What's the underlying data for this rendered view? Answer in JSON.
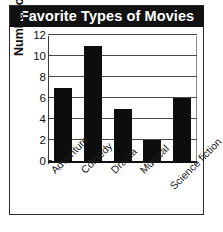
{
  "chart_data": {
    "type": "bar",
    "title": "Favorite Types of Movies",
    "xlabel": "",
    "ylabel": "Number of students",
    "categories": [
      "Adventure",
      "Comedy",
      "Drama",
      "Musical",
      "Science fiction"
    ],
    "values": [
      7,
      11,
      5,
      2,
      6
    ],
    "ylim": [
      0,
      12
    ],
    "yticks": [
      0,
      2,
      4,
      6,
      8,
      10,
      12
    ],
    "ytick_labels": [
      "0",
      "2",
      "4",
      "6",
      "8",
      "10",
      "12"
    ],
    "grid": true,
    "legend": false,
    "bar_color": "#0d0d0d",
    "title_background": "#111111",
    "title_color": "#ffffff"
  }
}
